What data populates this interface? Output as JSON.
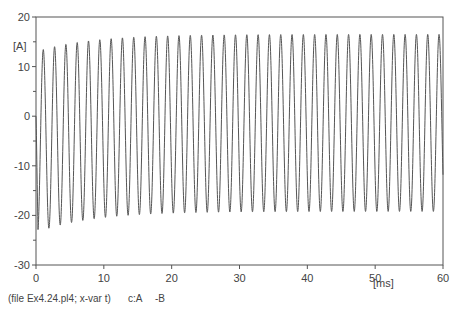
{
  "chart_data": {
    "type": "line",
    "title": "",
    "xlabel": "[ms]",
    "ylabel": "[A]",
    "xlim": [
      0,
      60
    ],
    "ylim": [
      -30,
      20
    ],
    "x_ticks": [
      0,
      10,
      20,
      30,
      40,
      50,
      60
    ],
    "x_tick_labels": [
      "0",
      "10",
      "20",
      "30",
      "40",
      "50",
      "60"
    ],
    "y_ticks": [
      -30,
      -20,
      -10,
      0,
      10,
      20
    ],
    "y_tick_labels": [
      "-30",
      "-20",
      "-10",
      "0",
      "10",
      "20"
    ],
    "grid": false,
    "legend": null,
    "series": [
      {
        "name": "c:A -B",
        "color": "#555555",
        "description": "Oscillating current with initial transient; period ~1.67 ms",
        "period_ms": 1.667,
        "steady_state_peak": 16.5,
        "steady_state_trough": -19.2,
        "initial_peak": 13.0,
        "initial_trough": -23.5,
        "envelope_time_constant_ms": 8,
        "x": [
          0,
          0.8,
          1.6,
          2.5,
          3.3,
          4.2,
          5.0,
          5.8,
          6.7,
          7.5,
          8.3,
          10.0,
          15.0,
          20.0,
          30.0,
          40.0,
          50.0,
          60.0
        ],
        "y": [
          0,
          -23.5,
          13.0,
          -22.5,
          14.0,
          -21.8,
          14.6,
          -21.2,
          15.1,
          -20.8,
          15.4,
          15.8,
          16.2,
          16.4,
          16.5,
          16.5,
          16.5,
          -19.2
        ]
      }
    ]
  },
  "caption": {
    "file_info": "(file Ex4.24.pl4; x-var t)",
    "curve_label": "c:A",
    "curve_ref": "-B"
  },
  "axis": {
    "y_unit": "[A]",
    "x_unit": "[ms]"
  }
}
